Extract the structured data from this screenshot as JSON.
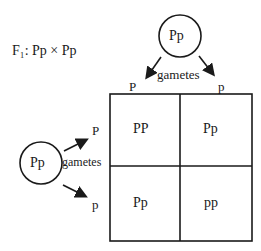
{
  "cross_label": "F₁: Pp × Pp",
  "top_parent": {
    "genotype": "Pp",
    "gametes_label": "gametes",
    "gametes": [
      "P",
      "p"
    ]
  },
  "left_parent": {
    "genotype": "Pp",
    "gametes_label": "gametes",
    "gametes": [
      "P",
      "p"
    ]
  },
  "punnett": {
    "rows": [
      [
        "PP",
        "Pp"
      ],
      [
        "Pp",
        "pp"
      ]
    ]
  }
}
